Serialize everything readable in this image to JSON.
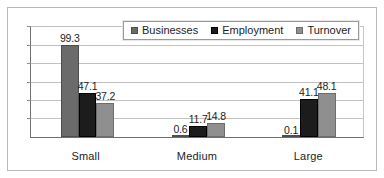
{
  "chart_data": {
    "type": "bar",
    "title": "",
    "subtitle": "",
    "xlabel": "",
    "ylabel": "",
    "categories": [
      "Small",
      "Medium",
      "Large"
    ],
    "series": [
      {
        "name": "Businesses",
        "color": "#6b6b6b",
        "values": [
          99.3,
          0.6,
          0.1
        ]
      },
      {
        "name": "Employment",
        "color": "#1c1c1c",
        "values": [
          47.1,
          11.7,
          41.1
        ]
      },
      {
        "name": "Turnover",
        "color": "#8f8f8f",
        "values": [
          37.2,
          14.8,
          48.1
        ]
      }
    ],
    "data_labels": [
      [
        "99.3",
        "47.1",
        "37.2"
      ],
      [
        "0.6",
        "11.7",
        "14.8"
      ],
      [
        "0.1",
        "41.1",
        "48.1"
      ]
    ],
    "ylim": [
      0,
      120
    ],
    "ytick_interval": 20,
    "ytick_labels": [],
    "grid": true,
    "legend_position": "top-right",
    "grouping": "grouped",
    "annotations": []
  },
  "legend": {
    "items": [
      {
        "label": "Businesses"
      },
      {
        "label": "Employment"
      },
      {
        "label": "Turnover"
      }
    ]
  },
  "axis": {
    "categories": [
      "Small",
      "Medium",
      "Large"
    ]
  }
}
